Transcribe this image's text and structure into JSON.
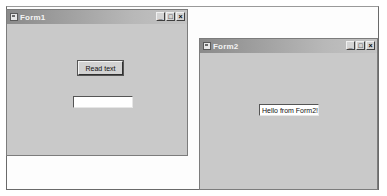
{
  "form1": {
    "title": "Form1",
    "read_button_label": "Read text",
    "textbox_value": "",
    "controls": {
      "minimize": "_",
      "maximize": "□",
      "close": "×"
    }
  },
  "form2": {
    "title": "Form2",
    "textbox_value": "Hello from Form2!",
    "controls": {
      "minimize": "_",
      "maximize": "□",
      "close": "×"
    }
  }
}
